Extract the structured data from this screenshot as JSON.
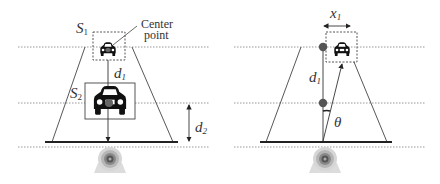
{
  "figure": {
    "left_panel": {
      "labels": {
        "s1": "S",
        "s1_sub": "1",
        "s2": "S",
        "s2_sub": "2",
        "center_point_line1": "Center",
        "center_point_line2": "point",
        "d1": "d",
        "d1_sub": "1",
        "d2": "d",
        "d2_sub": "2"
      },
      "icons": [
        "car-small-icon",
        "car-large-icon",
        "camera-icon"
      ]
    },
    "right_panel": {
      "labels": {
        "x1": "x",
        "x1_sub": "1",
        "d1": "d",
        "d1_sub": "1",
        "theta": "θ"
      },
      "icons": [
        "car-small-icon",
        "camera-icon",
        "point-dot-icon"
      ]
    },
    "colors": {
      "line": "#333333",
      "dotted": "#999999",
      "car": "#111111",
      "dot": "#555555",
      "camera": "#bbbbbb"
    }
  }
}
